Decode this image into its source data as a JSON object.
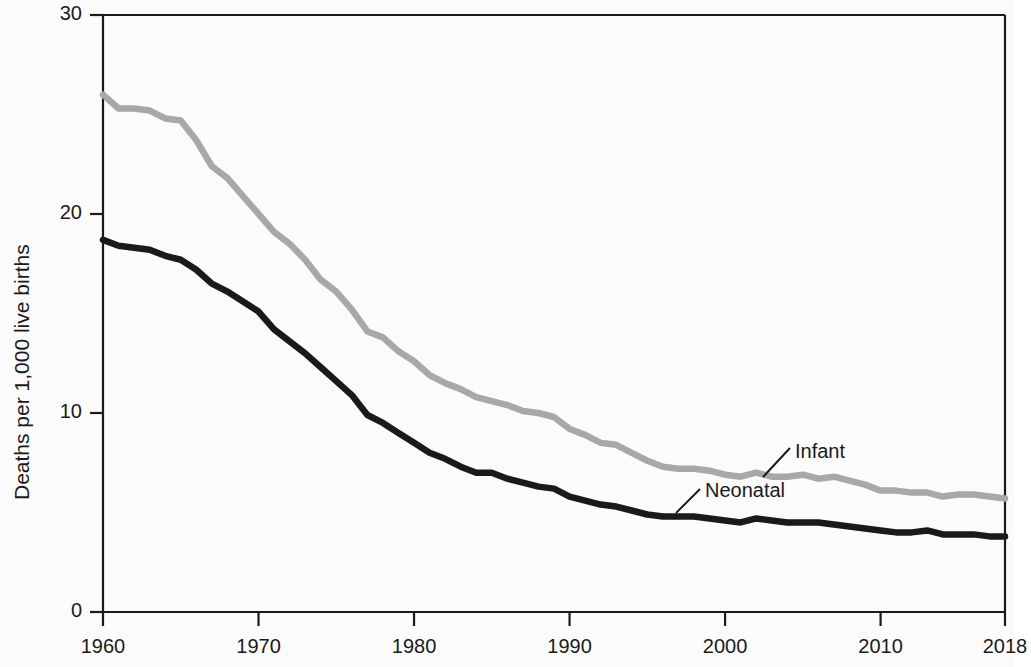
{
  "chart_data": {
    "type": "line",
    "title": "",
    "subtitle": "",
    "xlabel": "",
    "ylabel": "Deaths per 1,000 live births",
    "xlim": [
      1960,
      2018
    ],
    "ylim": [
      0,
      30
    ],
    "x_ticks": [
      1960,
      1970,
      1980,
      1990,
      2000,
      2010,
      2018
    ],
    "x_tick_labels": [
      "1960",
      "1970",
      "1980",
      "1990",
      "2000",
      "2010",
      "2018"
    ],
    "y_ticks": [
      0,
      10,
      20,
      30
    ],
    "y_tick_labels": [
      "0",
      "10",
      "20",
      "30"
    ],
    "grid": false,
    "legend": "inline-annotations",
    "annotations": [
      {
        "text": "Infant",
        "series": "Infant",
        "x": 2005,
        "y": 6.7
      },
      {
        "text": "Neonatal",
        "series": "Neonatal",
        "x": 1999,
        "y": 4.7
      }
    ],
    "colors": {
      "infant": "#a8a8a8",
      "neonatal": "#1a1a1a",
      "axis": "#1a1a1a",
      "background": "#fbfbfb"
    },
    "x": [
      1960,
      1961,
      1962,
      1963,
      1964,
      1965,
      1966,
      1967,
      1968,
      1969,
      1970,
      1971,
      1972,
      1973,
      1974,
      1975,
      1976,
      1977,
      1978,
      1979,
      1980,
      1981,
      1982,
      1983,
      1984,
      1985,
      1986,
      1987,
      1988,
      1989,
      1990,
      1991,
      1992,
      1993,
      1994,
      1995,
      1996,
      1997,
      1998,
      1999,
      2000,
      2001,
      2002,
      2003,
      2004,
      2005,
      2006,
      2007,
      2008,
      2009,
      2010,
      2011,
      2012,
      2013,
      2014,
      2015,
      2016,
      2017,
      2018
    ],
    "series": [
      {
        "name": "Infant",
        "color": "#a8a8a8",
        "values": [
          26.0,
          25.3,
          25.3,
          25.2,
          24.8,
          24.7,
          23.7,
          22.4,
          21.8,
          20.9,
          20.0,
          19.1,
          18.5,
          17.7,
          16.7,
          16.1,
          15.2,
          14.1,
          13.8,
          13.1,
          12.6,
          11.9,
          11.5,
          11.2,
          10.8,
          10.6,
          10.4,
          10.1,
          10.0,
          9.8,
          9.2,
          8.9,
          8.5,
          8.4,
          8.0,
          7.6,
          7.3,
          7.2,
          7.2,
          7.1,
          6.9,
          6.8,
          7.0,
          6.8,
          6.8,
          6.9,
          6.7,
          6.8,
          6.6,
          6.4,
          6.1,
          6.1,
          6.0,
          6.0,
          5.8,
          5.9,
          5.9,
          5.8,
          5.7
        ]
      },
      {
        "name": "Neonatal",
        "color": "#1a1a1a",
        "values": [
          18.7,
          18.4,
          18.3,
          18.2,
          17.9,
          17.7,
          17.2,
          16.5,
          16.1,
          15.6,
          15.1,
          14.2,
          13.6,
          13.0,
          12.3,
          11.6,
          10.9,
          9.9,
          9.5,
          9.0,
          8.5,
          8.0,
          7.7,
          7.3,
          7.0,
          7.0,
          6.7,
          6.5,
          6.3,
          6.2,
          5.8,
          5.6,
          5.4,
          5.3,
          5.1,
          4.9,
          4.8,
          4.8,
          4.8,
          4.7,
          4.6,
          4.5,
          4.7,
          4.6,
          4.5,
          4.5,
          4.5,
          4.4,
          4.3,
          4.2,
          4.1,
          4.0,
          4.0,
          4.1,
          3.9,
          3.9,
          3.9,
          3.8,
          3.8
        ]
      }
    ]
  }
}
